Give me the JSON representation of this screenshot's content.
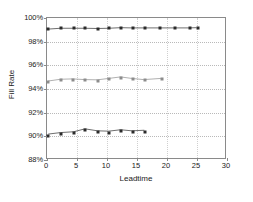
{
  "chart_data": {
    "type": "line",
    "title": "",
    "xlabel": "Leadtime",
    "ylabel": "Fill Rate",
    "xlim": [
      0,
      30
    ],
    "ylim": [
      88,
      100
    ],
    "grid": true,
    "grid_orientation": "horizontal-dotted",
    "legend": "none",
    "y_tick_labels": [
      "88%",
      "90%",
      "92%",
      "94%",
      "96%",
      "98%",
      "100%"
    ],
    "y_ticks": [
      88,
      90,
      92,
      94,
      96,
      98,
      100
    ],
    "x_tick_labels": [
      "0",
      "5",
      "10",
      "15",
      "20",
      "25",
      "30"
    ],
    "x_ticks": [
      0,
      5,
      10,
      15,
      20,
      25,
      30
    ],
    "series": [
      {
        "name": "upper-series",
        "color": "#2b2b2b",
        "marker": "square",
        "x": [
          0.2,
          2.3,
          4.5,
          6.4,
          8.5,
          10.4,
          12.4,
          14.3,
          16.3,
          18.9,
          21.3,
          23.9,
          25.2
        ],
        "values": [
          99.05,
          99.12,
          99.12,
          99.12,
          99.1,
          99.12,
          99.17,
          99.15,
          99.15,
          99.15,
          99.15,
          99.15,
          99.17
        ]
      },
      {
        "name": "middle-series",
        "color": "#8c8c8c",
        "marker": "square",
        "x": [
          0.2,
          2.3,
          4.3,
          6.4,
          8.5,
          10.4,
          12.4,
          14.3,
          16.3,
          19.2
        ],
        "values": [
          94.6,
          94.75,
          94.78,
          94.72,
          94.7,
          94.82,
          94.95,
          94.82,
          94.72,
          94.82
        ]
      },
      {
        "name": "lower-series",
        "color": "#2b2b2b",
        "marker": "square",
        "x": [
          0.2,
          2.3,
          4.5,
          6.4,
          8.5,
          10.4,
          12.4,
          14.3,
          16.4
        ],
        "values": [
          90.05,
          90.18,
          90.25,
          90.5,
          90.33,
          90.3,
          90.42,
          90.33,
          90.38
        ]
      }
    ]
  }
}
